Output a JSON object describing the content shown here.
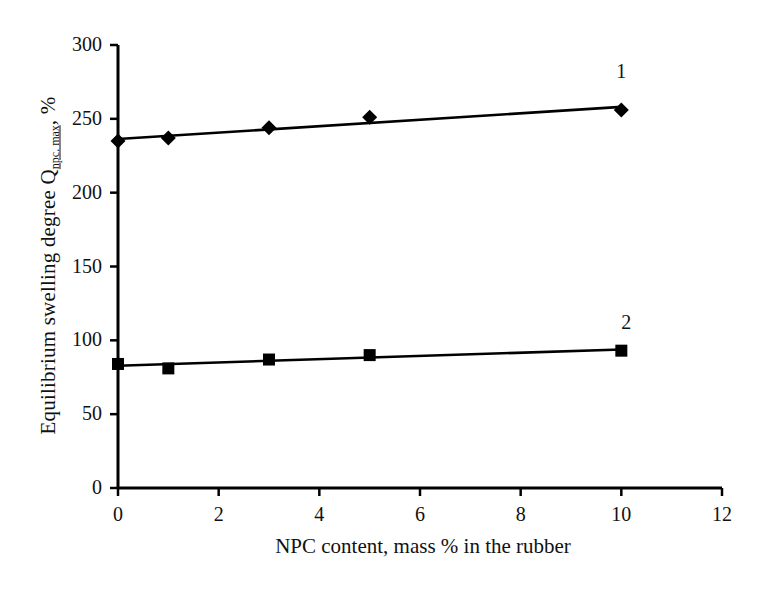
{
  "chart_data": {
    "type": "line",
    "title": "",
    "xlabel": "NPC content, mass % in the rubber",
    "ylabel_prefix": "Equilibrium swelling degree Q",
    "ylabel_subscript": "npc. max",
    "ylabel_suffix": ", %",
    "xlim": [
      0,
      12
    ],
    "ylim": [
      0,
      300
    ],
    "xticks": [
      0,
      2,
      4,
      6,
      8,
      10,
      12
    ],
    "yticks": [
      0,
      50,
      100,
      150,
      200,
      250,
      300
    ],
    "xtick_labels": [
      "0",
      "2",
      "4",
      "6",
      "8",
      "10",
      "12"
    ],
    "ytick_labels": [
      "0",
      "50",
      "100",
      "150",
      "200",
      "250",
      "300"
    ],
    "grid": false,
    "legend_position": "inline-end-labels",
    "series": [
      {
        "name": "1",
        "label": "1",
        "marker": "diamond",
        "color": "#000000",
        "x": [
          0,
          1,
          3,
          5,
          10
        ],
        "values": [
          235,
          237,
          244,
          251,
          256
        ]
      },
      {
        "name": "2",
        "label": "2",
        "marker": "square",
        "color": "#000000",
        "x": [
          0,
          1,
          3,
          5,
          10
        ],
        "values": [
          84,
          81,
          87,
          90,
          93
        ]
      }
    ],
    "annotations": [
      {
        "text": "1",
        "x": 10.0,
        "y": 281
      },
      {
        "text": "2",
        "x": 10.1,
        "y": 111
      }
    ]
  },
  "axis": {
    "line_color": "#000000",
    "tick_length": 8
  }
}
